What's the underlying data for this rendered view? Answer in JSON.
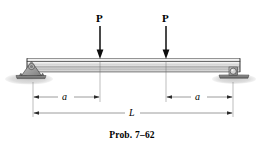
{
  "figure": {
    "caption": "Prob. 7–62",
    "colors": {
      "line": "#1a1a1a",
      "dimension_line": "#555555",
      "beam_light": "#f2f2f2",
      "beam_mid": "#b8b8b8",
      "beam_dark": "#8a8a8a",
      "support_fill": "#a8a8a8",
      "ground_shadow": "#d9d9d9",
      "background": "#ffffff"
    },
    "loads": [
      {
        "label": "P",
        "x": 100,
        "direction": "down"
      },
      {
        "label": "P",
        "x": 166,
        "direction": "down"
      }
    ],
    "dimensions": [
      {
        "label": "a",
        "from_x": 33,
        "to_x": 100,
        "y": 97
      },
      {
        "label": "a",
        "from_x": 166,
        "to_x": 233,
        "y": 97
      },
      {
        "label": "L",
        "from_x": 33,
        "to_x": 233,
        "y": 113
      }
    ],
    "supports": [
      {
        "type": "pin-support",
        "x": 33,
        "side": "left"
      },
      {
        "type": "roller-support",
        "x": 233,
        "side": "right"
      }
    ],
    "beam": {
      "left_x": 27,
      "right_x": 240,
      "top_y": 58,
      "bottom_y": 72
    }
  }
}
